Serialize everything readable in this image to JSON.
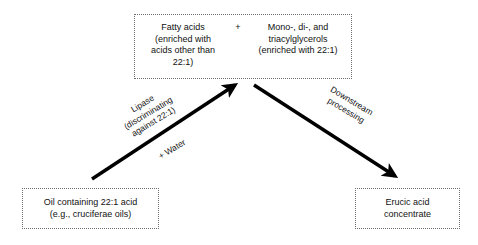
{
  "diagram": {
    "type": "process-flow",
    "stroke_color": "#000000",
    "box_border_color": "#6e6e6e",
    "background_color": "#ffffff",
    "nodes": [
      {
        "id": "feed",
        "position": "bottom-left",
        "lines": [
          "Oil containing 22:1 acid",
          "(e.g., cruciferae oils)"
        ]
      },
      {
        "id": "products",
        "position": "top-center",
        "separator": "+",
        "left_lines": [
          "Fatty acids",
          "(enriched with",
          "acids other than",
          "22:1)"
        ],
        "right_lines": [
          "Mono-, di-, and",
          "triacylglycerols",
          "(enriched with 22:1)"
        ]
      },
      {
        "id": "product_out",
        "position": "bottom-right",
        "lines": [
          "Erucic acid",
          "concentrate"
        ]
      }
    ],
    "edges": [
      {
        "id": "hydrolysis",
        "from": "feed",
        "to": "products",
        "direction": "up-right",
        "label_lines": [
          "Lipase",
          "(discriminating",
          "against 22:1)"
        ],
        "sublabel": "+ Water"
      },
      {
        "id": "downstream",
        "from": "products",
        "to": "product_out",
        "direction": "down-right",
        "label_lines": [
          "Downstream",
          "processing"
        ]
      }
    ]
  }
}
